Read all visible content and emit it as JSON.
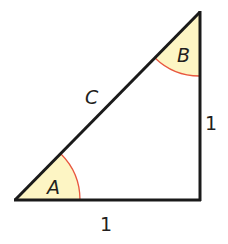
{
  "diagram": {
    "type": "right-triangle",
    "vertices": {
      "A": [
        15,
        200
      ],
      "right_angle": [
        200,
        200
      ],
      "B": [
        200,
        12
      ]
    },
    "angles": {
      "A": {
        "label": "A",
        "fill": "#fdf5c4",
        "arc_color": "#e8573f"
      },
      "B": {
        "label": "B",
        "fill": "#fdf5c4",
        "arc_color": "#e8573f"
      }
    },
    "sides": {
      "hypotenuse": {
        "label": "C"
      },
      "vertical": {
        "label": "1"
      },
      "horizontal": {
        "label": "1"
      }
    },
    "colors": {
      "line": "#1a1a1a",
      "angle_fill": "#fdf5c4",
      "arc": "#e8573f"
    }
  }
}
